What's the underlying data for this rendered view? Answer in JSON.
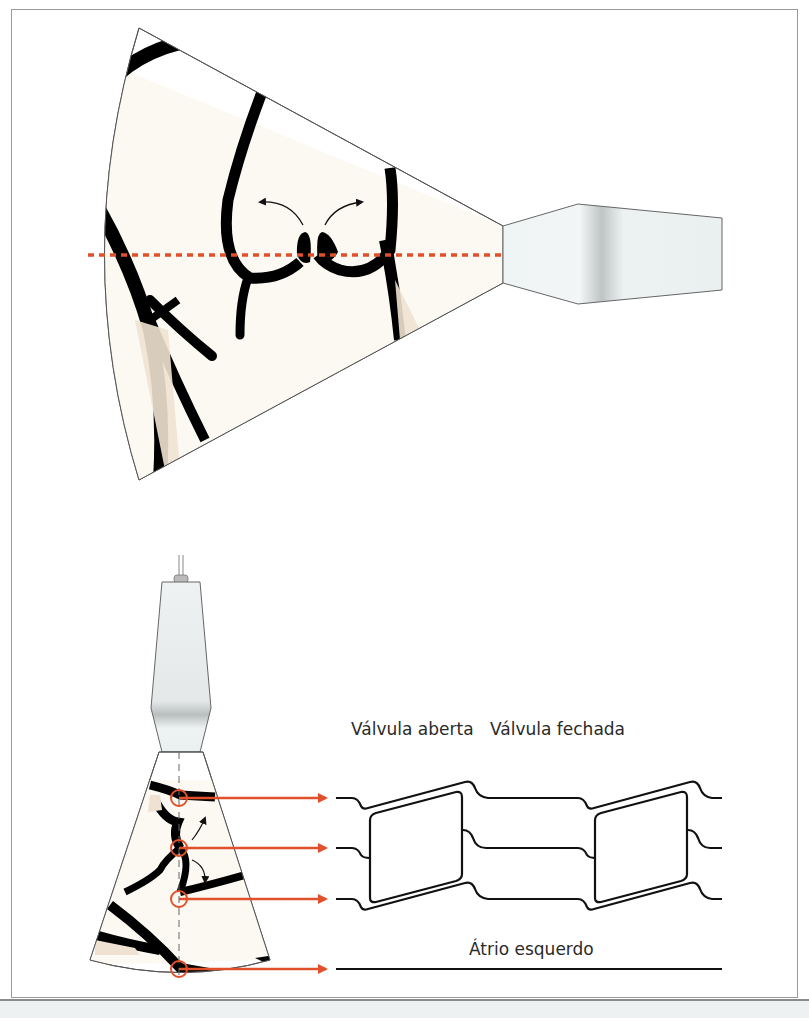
{
  "figure": {
    "top_panel": {
      "description": "Parasternal view: ultrasound sector with aortic valve cusps, M-mode cursor line",
      "cursor_color": "#e0502a"
    },
    "bottom_panel": {
      "description": "M-mode: sector with four cursor intersections mapped to traces",
      "labels": {
        "valve_open": "Válvula aberta",
        "valve_closed": "Válvula fechada",
        "left_atrium": "Átrio esquerdo"
      },
      "arrow_color": "#e0502a",
      "trace_color": "#111111"
    },
    "colors": {
      "tissue_fill": "#fbf9f2",
      "wall_fill": "#000000",
      "probe_fill": "#e8eeee",
      "frame_border": "#9a9a9a",
      "footer_bg": "#eef1f1"
    }
  }
}
